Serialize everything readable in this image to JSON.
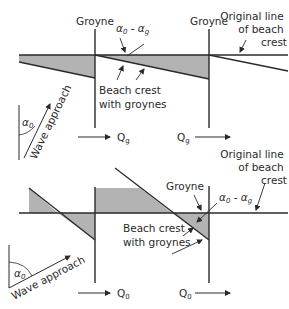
{
  "colors": {
    "line": "#2a2a2a",
    "shade": "#b3b3b3",
    "text": "#2a2a2a",
    "background": "#ffffff"
  },
  "top_diagram": {
    "groyne_left_label": "Groyne",
    "groyne_right_label": "Groyne",
    "angle_label": "α",
    "angle_label_sub0": "0",
    "angle_label_mid": " - α",
    "angle_label_subg": "g",
    "original_line_label": [
      "Original line",
      "of beach",
      "crest"
    ],
    "beach_crest_label": [
      "Beach crest",
      "with groynes"
    ],
    "transport_left": {
      "symbol": "Q",
      "sub": "g"
    },
    "transport_right": {
      "symbol": "Q",
      "sub": "g"
    },
    "wave_approach_label": "Wave approach",
    "wave_angle_label": {
      "symbol": "α",
      "sub": "0"
    }
  },
  "bottom_diagram": {
    "groyne_label": "Groyne",
    "angle_label": "α",
    "angle_label_sub0": "0",
    "angle_label_mid": " - α",
    "angle_label_subg": "g",
    "original_line_label": [
      "Original line",
      "of beach",
      "crest"
    ],
    "beach_crest_label": [
      "Beach crest",
      "with groynes"
    ],
    "transport_left": {
      "symbol": "Q",
      "sub": "0"
    },
    "transport_right": {
      "symbol": "Q",
      "sub": "0"
    },
    "wave_approach_label": "Wave approach",
    "wave_angle_label": {
      "symbol": "α",
      "sub": "0"
    }
  }
}
